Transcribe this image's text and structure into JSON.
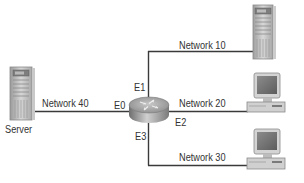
{
  "diagram": {
    "type": "network-topology",
    "router": {
      "interfaces": [
        {
          "name": "E0",
          "network": "Network 40",
          "connects_to": "Server"
        },
        {
          "name": "E1",
          "network": "Network 10",
          "connects_to": "Server"
        },
        {
          "name": "E2",
          "network": "Network 20",
          "connects_to": "Workstation"
        },
        {
          "name": "E3",
          "network": "Network 30",
          "connects_to": "Workstation"
        }
      ]
    },
    "labels": {
      "server": "Server",
      "net10": "Network 10",
      "net20": "Network 20",
      "net30": "Network 30",
      "net40": "Network 40",
      "e0": "E0",
      "e1": "E1",
      "e2": "E2",
      "e3": "E3"
    },
    "icons": {
      "left_server": "server-tower-icon",
      "top_right_server": "server-tower-icon",
      "pc_middle": "desktop-pc-icon",
      "pc_bottom": "desktop-pc-icon",
      "router": "router-icon"
    },
    "colors": {
      "line": "#3a3a3a",
      "text": "#333333",
      "device_gray": "#b8b8b8"
    }
  }
}
